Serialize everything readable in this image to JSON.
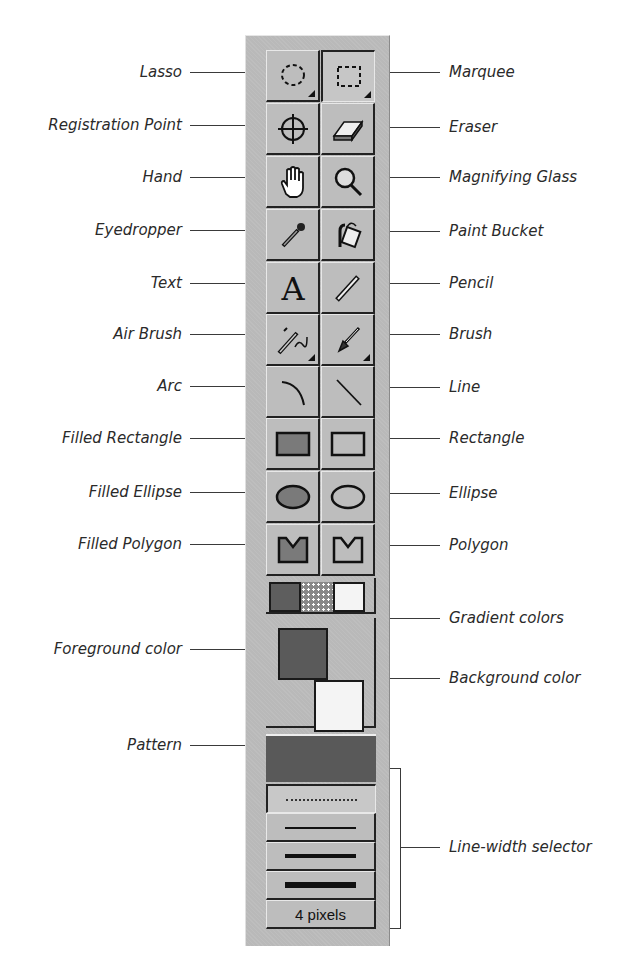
{
  "toolbar": {
    "tools": [
      {
        "row": 0,
        "left": {
          "label": "Lasso",
          "icon": "lasso-icon",
          "has_options": true,
          "pressed": false
        },
        "right": {
          "label": "Marquee",
          "icon": "marquee-icon",
          "has_options": true,
          "pressed": true
        }
      },
      {
        "row": 1,
        "left": {
          "label": "Registration Point",
          "icon": "registration-point-icon"
        },
        "right": {
          "label": "Eraser",
          "icon": "eraser-icon"
        }
      },
      {
        "row": 2,
        "left": {
          "label": "Hand",
          "icon": "hand-icon"
        },
        "right": {
          "label": "Magnifying Glass",
          "icon": "magnifying-glass-icon"
        }
      },
      {
        "row": 3,
        "left": {
          "label": "Eyedropper",
          "icon": "eyedropper-icon"
        },
        "right": {
          "label": "Paint Bucket",
          "icon": "paint-bucket-icon"
        }
      },
      {
        "row": 4,
        "left": {
          "label": "Text",
          "icon": "text-icon"
        },
        "right": {
          "label": "Pencil",
          "icon": "pencil-icon"
        }
      },
      {
        "row": 5,
        "left": {
          "label": "Air Brush",
          "icon": "air-brush-icon",
          "has_options": true
        },
        "right": {
          "label": "Brush",
          "icon": "brush-icon",
          "has_options": true
        }
      },
      {
        "row": 6,
        "left": {
          "label": "Arc",
          "icon": "arc-icon"
        },
        "right": {
          "label": "Line",
          "icon": "line-icon"
        }
      },
      {
        "row": 7,
        "left": {
          "label": "Filled Rectangle",
          "icon": "filled-rectangle-icon"
        },
        "right": {
          "label": "Rectangle",
          "icon": "rectangle-icon"
        }
      },
      {
        "row": 8,
        "left": {
          "label": "Filled Ellipse",
          "icon": "filled-ellipse-icon"
        },
        "right": {
          "label": "Ellipse",
          "icon": "ellipse-icon"
        }
      },
      {
        "row": 9,
        "left": {
          "label": "Filled Polygon",
          "icon": "filled-polygon-icon"
        },
        "right": {
          "label": "Polygon",
          "icon": "polygon-icon"
        }
      }
    ],
    "colors": {
      "gradient_label": "Gradient colors",
      "foreground_label": "Foreground color",
      "background_label": "Background color",
      "foreground": "#5a5a5a",
      "background": "#f4f4f4",
      "pattern_label": "Pattern",
      "pattern_color": "#595959"
    },
    "line_width": {
      "label": "Line-width selector",
      "options": [
        "dotted",
        "1",
        "2",
        "3"
      ],
      "current_value": "4 pixels"
    }
  },
  "labels": {
    "lasso": "Lasso",
    "marquee": "Marquee",
    "registration_point": "Registration Point",
    "eraser": "Eraser",
    "hand": "Hand",
    "magnifying_glass": "Magnifying Glass",
    "eyedropper": "Eyedropper",
    "paint_bucket": "Paint Bucket",
    "text": "Text",
    "pencil": "Pencil",
    "air_brush": "Air Brush",
    "brush": "Brush",
    "arc": "Arc",
    "line": "Line",
    "filled_rectangle": "Filled Rectangle",
    "rectangle": "Rectangle",
    "filled_ellipse": "Filled Ellipse",
    "ellipse": "Ellipse",
    "filled_polygon": "Filled Polygon",
    "polygon": "Polygon",
    "gradient_colors": "Gradient colors",
    "foreground_color": "Foreground color",
    "background_color": "Background color",
    "pattern": "Pattern",
    "line_width_selector": "Line-width selector"
  }
}
